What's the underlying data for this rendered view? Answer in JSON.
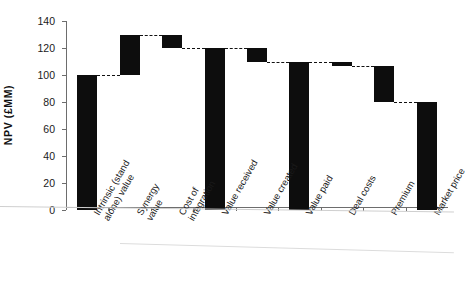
{
  "chart_data": {
    "type": "bar",
    "subtype": "waterfall",
    "title": "",
    "xlabel": "",
    "ylabel": "NPV (£MM)",
    "ylim": [
      0,
      140
    ],
    "yticks": [
      0,
      20,
      40,
      60,
      80,
      100,
      120,
      140
    ],
    "ytick_labels": [
      "0",
      "20",
      "40",
      "60",
      "80",
      "100",
      "120",
      "140"
    ],
    "grid": false,
    "legend": null,
    "connectors": true,
    "bar_color": "#0d0d0d",
    "categories": [
      "Intrinsic (stand alone) value",
      "Synergy value",
      "Cost of integration",
      "Value received",
      "Value created",
      "Value paid",
      "Deal costs",
      "Premium",
      "Market price"
    ],
    "category_lines": [
      [
        "Intrinsic (stand",
        "alone) value"
      ],
      [
        "Synergy",
        "value"
      ],
      [
        "Cost of",
        "integration"
      ],
      [
        "Value received"
      ],
      [
        "Value created"
      ],
      [
        "Value paid"
      ],
      [
        "Deal costs"
      ],
      [
        "Premium"
      ],
      [
        "Market price"
      ]
    ],
    "bars": [
      {
        "label": "Intrinsic (stand alone) value",
        "base": 0,
        "top": 100,
        "value": 100,
        "type": "total"
      },
      {
        "label": "Synergy value",
        "base": 100,
        "top": 130,
        "value": 30,
        "type": "increase"
      },
      {
        "label": "Cost of integration",
        "base": 120,
        "top": 130,
        "value": -10,
        "type": "decrease"
      },
      {
        "label": "Value received",
        "base": 0,
        "top": 120,
        "value": 120,
        "type": "total"
      },
      {
        "label": "Value created",
        "base": 110,
        "top": 120,
        "value": -10,
        "type": "decrease"
      },
      {
        "label": "Value paid",
        "base": 0,
        "top": 110,
        "value": 110,
        "type": "total"
      },
      {
        "label": "Deal costs",
        "base": 107,
        "top": 110,
        "value": -3,
        "type": "decrease"
      },
      {
        "label": "Premium",
        "base": 80,
        "top": 107,
        "value": -27,
        "type": "decrease"
      },
      {
        "label": "Market price",
        "base": 0,
        "top": 80,
        "value": 80,
        "type": "total"
      }
    ],
    "values": [
      100,
      130,
      130,
      120,
      120,
      110,
      110,
      107,
      80
    ]
  }
}
